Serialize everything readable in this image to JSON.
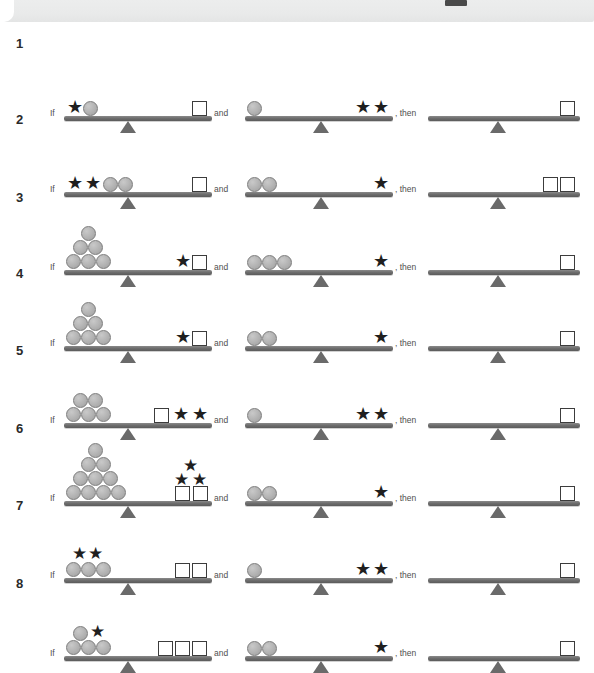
{
  "page": {
    "top_strip": {
      "mark": "page-edge-mark"
    },
    "connector_if": "If",
    "connector_and": "and",
    "connector_then": ", then"
  },
  "legend": {
    "shapes": [
      "circle",
      "star",
      "square"
    ],
    "colors": {
      "circle_fill": "#b2b2b2",
      "circle_stroke": "#7d7d7d",
      "star_fill": "#1f1f1f",
      "square_fill": "#ffffff",
      "square_stroke": "#3c3c3c",
      "beam": "#6e6e6e",
      "fulcrum": "#6a6a6a",
      "row_number": "#2a2a2a",
      "connector_text": "#4f4f4f",
      "top_strip": "#eceded"
    }
  },
  "rows": [
    {
      "number": "1",
      "premise1": {
        "left": {
          "circles": 1,
          "stars": 1,
          "squares": 0,
          "layout": "star-circle-inline"
        },
        "right": {
          "circles": 0,
          "stars": 0,
          "squares": 1
        }
      },
      "premise2": {
        "left": {
          "circles": 1,
          "stars": 0,
          "squares": 0
        },
        "right": {
          "circles": 0,
          "stars": 2,
          "squares": 0
        }
      },
      "conclusion": {
        "left": {
          "circles": 0,
          "stars": 0,
          "squares": 0
        },
        "right": {
          "circles": 0,
          "stars": 0,
          "squares": 1
        }
      }
    },
    {
      "number": "2",
      "premise1": {
        "left": {
          "circles": 2,
          "stars": 2,
          "squares": 0,
          "layout": "stars-then-circles"
        },
        "right": {
          "circles": 0,
          "stars": 0,
          "squares": 1
        }
      },
      "premise2": {
        "left": {
          "circles": 2,
          "stars": 0,
          "squares": 0
        },
        "right": {
          "circles": 0,
          "stars": 1,
          "squares": 0
        }
      },
      "conclusion": {
        "left": {
          "circles": 0,
          "stars": 0,
          "squares": 0
        },
        "right": {
          "circles": 0,
          "stars": 0,
          "squares": 2
        }
      }
    },
    {
      "number": "3",
      "premise1": {
        "left": {
          "circles": 6,
          "stars": 0,
          "squares": 0,
          "layout": "pyramid-3-2-1"
        },
        "right": {
          "circles": 0,
          "stars": 1,
          "squares": 1
        }
      },
      "premise2": {
        "left": {
          "circles": 3,
          "stars": 0,
          "squares": 0
        },
        "right": {
          "circles": 0,
          "stars": 1,
          "squares": 0
        }
      },
      "conclusion": {
        "left": {
          "circles": 0,
          "stars": 0,
          "squares": 0
        },
        "right": {
          "circles": 0,
          "stars": 0,
          "squares": 1
        }
      }
    },
    {
      "number": "4",
      "premise1": {
        "left": {
          "circles": 6,
          "stars": 0,
          "squares": 0,
          "layout": "pyramid-3-2-1"
        },
        "right": {
          "circles": 0,
          "stars": 1,
          "squares": 1
        }
      },
      "premise2": {
        "left": {
          "circles": 2,
          "stars": 0,
          "squares": 0
        },
        "right": {
          "circles": 0,
          "stars": 1,
          "squares": 0
        }
      },
      "conclusion": {
        "left": {
          "circles": 0,
          "stars": 0,
          "squares": 0
        },
        "right": {
          "circles": 0,
          "stars": 0,
          "squares": 1
        }
      }
    },
    {
      "number": "5",
      "premise1": {
        "left": {
          "circles": 5,
          "stars": 0,
          "squares": 0,
          "layout": "pyramid-3-2"
        },
        "right": {
          "circles": 0,
          "stars": 2,
          "squares": 1,
          "layout": "square-then-stars"
        }
      },
      "premise2": {
        "left": {
          "circles": 1,
          "stars": 0,
          "squares": 0
        },
        "right": {
          "circles": 0,
          "stars": 2,
          "squares": 0
        }
      },
      "conclusion": {
        "left": {
          "circles": 0,
          "stars": 0,
          "squares": 0
        },
        "right": {
          "circles": 0,
          "stars": 0,
          "squares": 1
        }
      }
    },
    {
      "number": "6",
      "premise1": {
        "left": {
          "circles": 10,
          "stars": 0,
          "squares": 0,
          "layout": "pyramid-4-3-2-1"
        },
        "right": {
          "circles": 0,
          "stars": 3,
          "squares": 2,
          "layout": "squares-with-stars-above"
        }
      },
      "premise2": {
        "left": {
          "circles": 2,
          "stars": 0,
          "squares": 0
        },
        "right": {
          "circles": 0,
          "stars": 1,
          "squares": 0
        }
      },
      "conclusion": {
        "left": {
          "circles": 0,
          "stars": 0,
          "squares": 0
        },
        "right": {
          "circles": 0,
          "stars": 0,
          "squares": 1
        }
      }
    },
    {
      "number": "7",
      "premise1": {
        "left": {
          "circles": 3,
          "stars": 2,
          "squares": 0,
          "layout": "circles-with-stars-above"
        },
        "right": {
          "circles": 0,
          "stars": 0,
          "squares": 2
        }
      },
      "premise2": {
        "left": {
          "circles": 1,
          "stars": 0,
          "squares": 0
        },
        "right": {
          "circles": 0,
          "stars": 2,
          "squares": 0
        }
      },
      "conclusion": {
        "left": {
          "circles": 0,
          "stars": 0,
          "squares": 0
        },
        "right": {
          "circles": 0,
          "stars": 0,
          "squares": 1
        }
      }
    },
    {
      "number": "8",
      "premise1": {
        "left": {
          "circles": 4,
          "stars": 1,
          "squares": 0,
          "layout": "circles-3-plus-circle-star-above"
        },
        "right": {
          "circles": 0,
          "stars": 0,
          "squares": 3
        }
      },
      "premise2": {
        "left": {
          "circles": 2,
          "stars": 0,
          "squares": 0
        },
        "right": {
          "circles": 0,
          "stars": 1,
          "squares": 0
        }
      },
      "conclusion": {
        "left": {
          "circles": 0,
          "stars": 0,
          "squares": 0
        },
        "right": {
          "circles": 0,
          "stars": 0,
          "squares": 1
        }
      }
    }
  ]
}
